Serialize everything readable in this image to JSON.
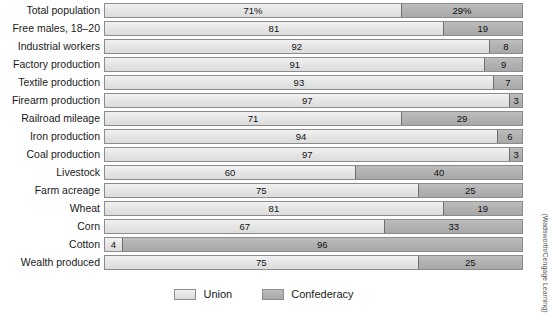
{
  "chart_data": {
    "type": "bar",
    "orientation": "horizontal",
    "stacked": true,
    "normalized_percent": true,
    "title": "",
    "subtitle": "",
    "xlabel": "",
    "ylabel": "",
    "xlim": [
      0,
      100
    ],
    "grid": false,
    "legend_position": "bottom-center",
    "categories": [
      "Total population",
      "Free males, 18–20",
      "Industrial workers",
      "Factory production",
      "Textile production",
      "Firearm production",
      "Railroad mileage",
      "Iron production",
      "Coal production",
      "Livestock",
      "Farm acreage",
      "Wheat",
      "Corn",
      "Cotton",
      "Wealth produced"
    ],
    "series": [
      {
        "name": "Union",
        "color": "#e6e6e6",
        "values": [
          71,
          81,
          92,
          91,
          93,
          97,
          71,
          94,
          97,
          60,
          75,
          81,
          67,
          4,
          75
        ],
        "labels": [
          "71%",
          "81",
          "92",
          "91",
          "93",
          "97",
          "71",
          "94",
          "97",
          "60",
          "75",
          "81",
          "67",
          "4",
          "75"
        ]
      },
      {
        "name": "Confederacy",
        "color": "#b2b2b2",
        "values": [
          29,
          19,
          8,
          9,
          7,
          3,
          29,
          6,
          3,
          40,
          25,
          19,
          33,
          96,
          25
        ],
        "labels": [
          "29%",
          "19",
          "8",
          "9",
          "7",
          "3",
          "29",
          "6",
          "3",
          "40",
          "25",
          "19",
          "33",
          "96",
          "25"
        ]
      }
    ],
    "annotations": [
      "(Wadsworth/Cengage Learning)"
    ]
  },
  "legend": {
    "items": [
      {
        "label": "Union",
        "swatch": "union"
      },
      {
        "label": "Confederacy",
        "swatch": "conf"
      }
    ]
  },
  "credit": {
    "text": "(Wadsworth/Cengage Learning)"
  }
}
